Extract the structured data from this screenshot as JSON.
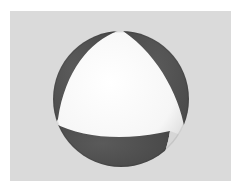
{
  "image": {
    "subject": "Shaded sphere with alternating white and dark gray curved patches",
    "background_color": "#dadada",
    "border_color": "#ffffff",
    "colors": {
      "light_patch": "#fafafa",
      "dark_patch": "#4a4a4a",
      "shadow_edge": "#c8c8c8"
    }
  }
}
